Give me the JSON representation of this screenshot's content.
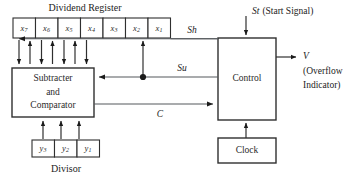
{
  "diagram": {
    "title_top": "Dividend Register",
    "title_bottom": "Divisor",
    "dividend_register": {
      "name": "Dividend Register",
      "cells": [
        {
          "base": "x",
          "sub": "7"
        },
        {
          "base": "x",
          "sub": "6"
        },
        {
          "base": "x",
          "sub": "5"
        },
        {
          "base": "x",
          "sub": "4"
        },
        {
          "base": "x",
          "sub": "3"
        },
        {
          "base": "x",
          "sub": "2"
        },
        {
          "base": "x",
          "sub": "1"
        }
      ]
    },
    "divisor_register": {
      "name": "Divisor",
      "cells": [
        {
          "base": "y",
          "sub": "3"
        },
        {
          "base": "y",
          "sub": "2"
        },
        {
          "base": "y",
          "sub": "1"
        }
      ]
    },
    "blocks": {
      "subtracter_line1": "Subtracter",
      "subtracter_line2": "and",
      "subtracter_line3": "Comparator",
      "control": "Control",
      "clock": "Clock"
    },
    "signals": {
      "sh": "Sh",
      "su": "Su",
      "c": "C",
      "st_symbol": "St",
      "st_text": "(Start Signal)",
      "v_symbol": "V",
      "v_text_line1": "(Overflow",
      "v_text_line2": "Indicator)"
    },
    "colors": {
      "ink": "#2b2b2b",
      "wire": "#55585c",
      "box_stroke": "#2f2f2f",
      "background": "#ffffff"
    }
  }
}
